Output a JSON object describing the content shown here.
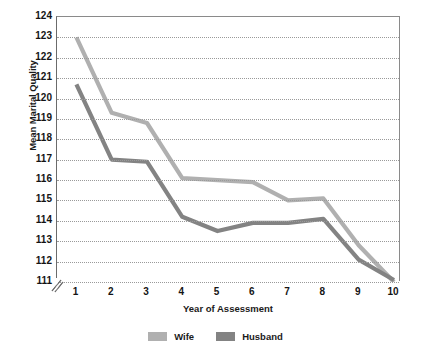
{
  "chart_data": {
    "type": "line",
    "title": "",
    "xlabel": "Year of Assessment",
    "ylabel": "Mean Marital Quality",
    "x": [
      1,
      2,
      3,
      4,
      5,
      6,
      7,
      8,
      9,
      10
    ],
    "xtick_labels": [
      "1",
      "2",
      "3",
      "4",
      "5",
      "6",
      "7",
      "8",
      "9",
      "10"
    ],
    "ytick_labels": [
      "124",
      "123",
      "122",
      "121",
      "120",
      "119",
      "118",
      "117",
      "116",
      "115",
      "114",
      "113",
      "112",
      "111"
    ],
    "yticks": [
      124,
      123,
      122,
      121,
      120,
      119,
      118,
      117,
      116,
      115,
      114,
      113,
      112,
      111
    ],
    "ylim": [
      111,
      124
    ],
    "xlim": [
      0.45,
      10.2
    ],
    "grid": true,
    "grid_style": "dotted-horizontal",
    "axis_break": true,
    "legend_position": "bottom-center",
    "series": [
      {
        "name": "Wife",
        "color": "#b0b0b0",
        "values": [
          123.0,
          119.3,
          118.8,
          116.1,
          116.0,
          115.9,
          115.0,
          115.1,
          112.8,
          111.0
        ]
      },
      {
        "name": "Husband",
        "color": "#838383",
        "values": [
          120.7,
          117.0,
          116.9,
          114.2,
          113.5,
          113.9,
          113.9,
          114.1,
          112.1,
          111.1
        ]
      }
    ]
  },
  "legend": {
    "items": [
      {
        "label": "Wife",
        "color": "#b0b0b0"
      },
      {
        "label": "Husband",
        "color": "#838383"
      }
    ]
  }
}
